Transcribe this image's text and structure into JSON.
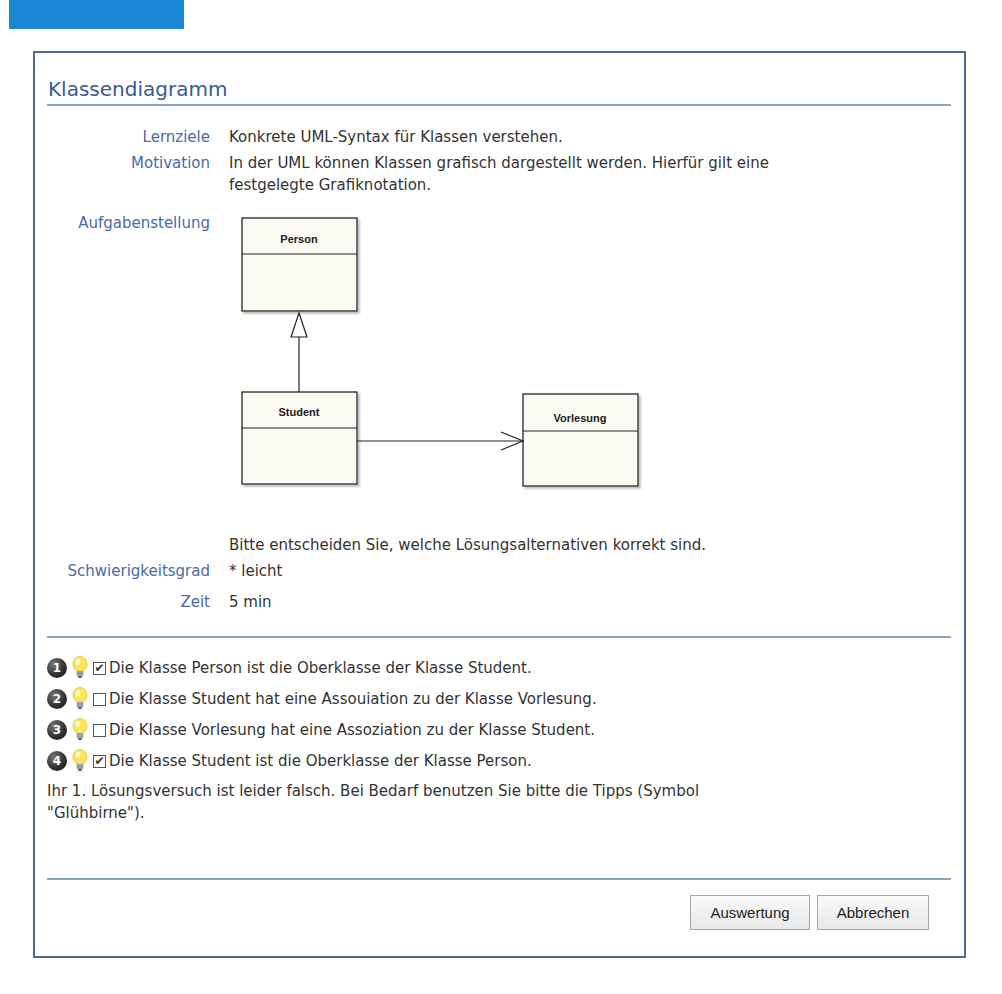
{
  "header": {
    "accent_color": "#1a86d6"
  },
  "dialog": {
    "title": "Klassendiagramm",
    "fields": {
      "lernziele": {
        "label": "Lernziele",
        "value": "Konkrete UML-Syntax für Klassen verstehen."
      },
      "motivation": {
        "label": "Motivation",
        "value_line1": "In der UML können Klassen grafisch dargestellt werden. Hierfür gilt eine",
        "value_line2": "festgelegte Grafiknotation."
      },
      "aufgabenstellung": {
        "label": "Aufgabenstellung",
        "instruction": "Bitte entscheiden Sie, welche Lösungsalternativen korrekt sind."
      },
      "schwierigkeitsgrad": {
        "label": "Schwierigkeitsgrad",
        "value": "* leicht"
      },
      "zeit": {
        "label": "Zeit",
        "value": "5 min"
      }
    },
    "diagram": {
      "classes": [
        {
          "name": "Person"
        },
        {
          "name": "Student"
        },
        {
          "name": "Vorlesung"
        }
      ],
      "relations": [
        {
          "from": "Student",
          "to": "Person",
          "type": "generalization"
        },
        {
          "from": "Student",
          "to": "Vorlesung",
          "type": "directed-association"
        }
      ]
    },
    "options": [
      {
        "number": "1",
        "checked": true,
        "mark": "✔",
        "text": "Die Klasse Person ist die Oberklasse der Klasse Student."
      },
      {
        "number": "2",
        "checked": false,
        "mark": "",
        "text": "Die Klasse Student hat eine Assouiation zu der Klasse Vorlesung."
      },
      {
        "number": "3",
        "checked": false,
        "mark": "",
        "text": "Die Klasse Vorlesung hat eine Assoziation zu der Klasse Student."
      },
      {
        "number": "4",
        "checked": true,
        "mark": "✔",
        "text": "Die Klasse Student ist die Oberklasse der Klasse Person."
      }
    ],
    "feedback_line1": "Ihr 1. Lösungsversuch ist leider falsch. Bei Bedarf benutzen Sie bitte die Tipps (Symbol",
    "feedback_line2": "\"Glühbirne\").",
    "buttons": {
      "evaluate": "Auswertung",
      "cancel": "Abbrechen"
    }
  }
}
